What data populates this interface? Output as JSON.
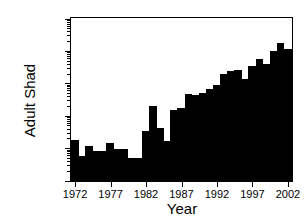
{
  "chart_data": {
    "type": "bar",
    "title": "",
    "xlabel": "Year",
    "ylabel": "Adult Shad",
    "yscale": "log",
    "ylim": [
      10,
      1000000
    ],
    "xlim": [
      1972,
      2002
    ],
    "grid": false,
    "legend": null,
    "bar_color": "#000000",
    "axis_color": "#000000",
    "background": "#ffffff",
    "ytick_labels": [
      "10",
      "100",
      "1000",
      "10000",
      "100000",
      "1000000"
    ],
    "ytick_values": [
      10,
      100,
      1000,
      10000,
      100000,
      1000000
    ],
    "xtick_labels": [
      "1972",
      "1977",
      "1982",
      "1987",
      "1992",
      "1997",
      "2002"
    ],
    "xtick_values": [
      1972,
      1977,
      1982,
      1987,
      1992,
      1997,
      2002
    ],
    "categories": [
      1972,
      1973,
      1974,
      1975,
      1976,
      1977,
      1978,
      1979,
      1980,
      1981,
      1982,
      1983,
      1984,
      1985,
      1986,
      1987,
      1988,
      1989,
      1990,
      1991,
      1992,
      1993,
      1994,
      1995,
      1996,
      1997,
      1998,
      1999,
      2000,
      2001,
      2002
    ],
    "values": [
      180,
      60,
      120,
      85,
      85,
      150,
      95,
      95,
      50,
      50,
      350,
      2000,
      420,
      170,
      1600,
      1800,
      5000,
      4500,
      5200,
      7000,
      9500,
      20000,
      25000,
      26000,
      14000,
      35000,
      60000,
      42000,
      100000,
      185000,
      120000
    ]
  }
}
